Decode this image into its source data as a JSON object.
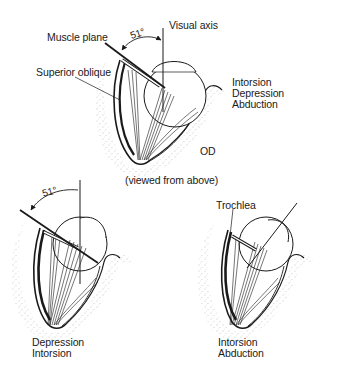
{
  "figure": {
    "top_view": {
      "labels": {
        "muscle_plane": "Muscle plane",
        "visual_axis": "Visual axis",
        "angle": "51°",
        "superior_oblique": "Superior oblique",
        "eye": "OD",
        "caption": "(viewed from above)"
      },
      "actions": [
        "Intorsion",
        "Depression",
        "Abduction"
      ]
    },
    "adducted_view": {
      "labels": {
        "angle": "51°"
      },
      "actions": [
        "Depression",
        "Intorsion"
      ]
    },
    "abducted_view": {
      "labels": {
        "trochlea": "Trochlea"
      },
      "actions": [
        "Intorsion",
        "Abduction"
      ]
    },
    "colors": {
      "ink": "#1a1a1a",
      "stipple": "#8a8a8a",
      "background": "#ffffff"
    }
  }
}
